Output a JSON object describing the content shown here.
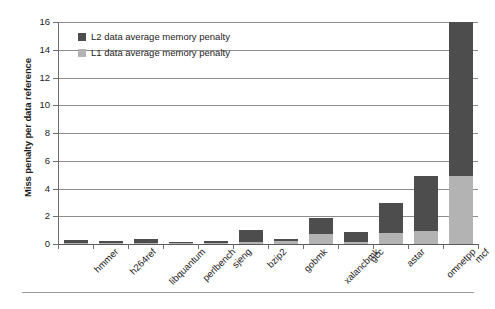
{
  "chart_data": {
    "type": "bar",
    "stacked": true,
    "title": "",
    "xlabel": "",
    "ylabel": "Miss penalty per data reference",
    "ylim": [
      0,
      16
    ],
    "ytick_step": 2,
    "yticks": [
      "16",
      "14",
      "12",
      "10",
      "8",
      "6",
      "4",
      "2",
      "0"
    ],
    "grid": true,
    "legend_position": "top-left",
    "categories": [
      "hmmer",
      "h264ref",
      "libquantum",
      "perlbench",
      "sjeng",
      "bzip2",
      "gobmk",
      "xalancbmk",
      "gcc",
      "astar",
      "omnetpp",
      "mcf"
    ],
    "series": [
      {
        "name": "L1 data average memory penalty",
        "color": "#b3b3b3",
        "values": [
          0.05,
          0.08,
          0.1,
          0.05,
          0.1,
          0.15,
          0.25,
          0.7,
          0.15,
          0.8,
          0.95,
          4.9
        ]
      },
      {
        "name": "L2 data average memory penalty",
        "color": "#4d4d4d",
        "values": [
          0.2,
          0.12,
          0.25,
          0.1,
          0.15,
          0.85,
          0.1,
          1.15,
          0.7,
          2.15,
          3.95,
          11.1
        ]
      }
    ],
    "totals": [
      0.25,
      0.2,
      0.35,
      0.15,
      0.25,
      1.0,
      0.35,
      1.85,
      0.85,
      2.95,
      4.9,
      16.0
    ]
  },
  "legend": {
    "items": [
      {
        "label": "L2 data average memory penalty",
        "swatch": "l2"
      },
      {
        "label": "L1 data average memory penalty",
        "swatch": "l1"
      }
    ]
  },
  "colors": {
    "l1": "#b3b3b3",
    "l2": "#4d4d4d",
    "axis": "#6f6f6f",
    "grid": "#8c8c8c",
    "background": "#ffffff"
  }
}
